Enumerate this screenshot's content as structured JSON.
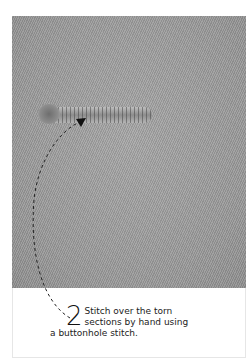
{
  "illustration": {
    "subject": "fabric-tear-repair-photo",
    "fabric_color": "#9c9c9c"
  },
  "caption": {
    "step_number": "2",
    "line1": "Stitch over the torn",
    "line2": "sections by hand using",
    "line3": "a buttonhole stitch."
  }
}
